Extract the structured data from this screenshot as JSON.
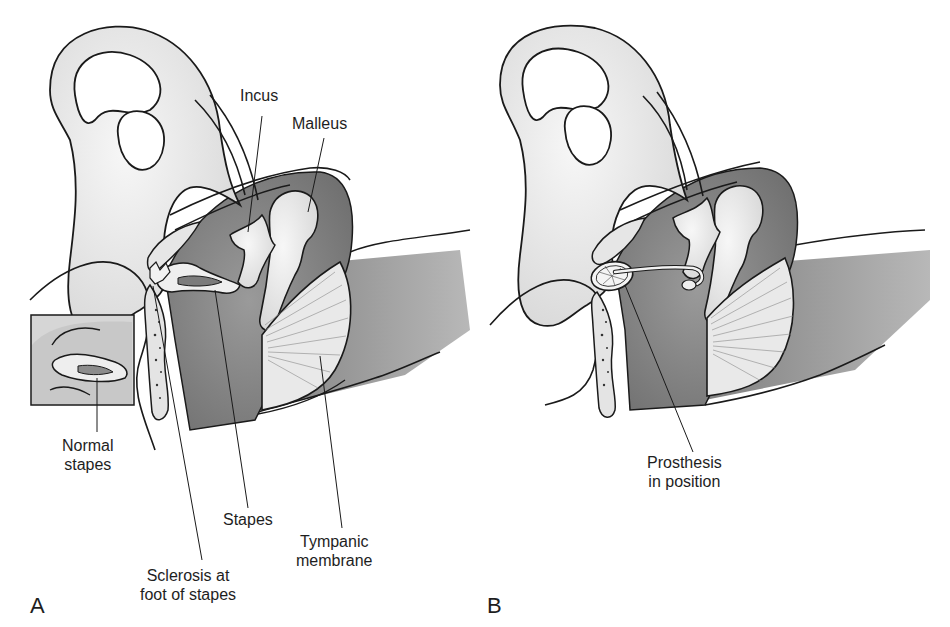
{
  "figure": {
    "panels": [
      {
        "id": "A",
        "letter": "A",
        "labels": {
          "incus": "Incus",
          "malleus": "Malleus",
          "normal_stapes_line1": "Normal",
          "normal_stapes_line2": "stapes",
          "stapes": "Stapes",
          "sclerosis_line1": "Sclerosis at",
          "sclerosis_line2": "foot of stapes",
          "tympanic_line1": "Tympanic",
          "tympanic_line2": "membrane"
        },
        "inset": "normal-stapes-inset"
      },
      {
        "id": "B",
        "letter": "B",
        "labels": {
          "prosthesis_line1": "Prosthesis",
          "prosthesis_line2": "in position"
        }
      }
    ],
    "colors": {
      "outline": "#1a1a1a",
      "bone_light": "#ececec",
      "cavity_dark": "#8a8a8a",
      "cavity_mid": "#a8a8a8",
      "background": "#ffffff"
    }
  }
}
